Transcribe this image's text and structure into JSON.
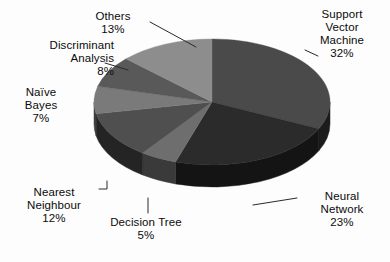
{
  "chart_data": {
    "type": "pie",
    "title": "",
    "subtitle": "",
    "xlabel": "",
    "ylabel": "",
    "legend_position": "none",
    "grid": false,
    "three_d": true,
    "categories": [
      "Support Vector Machine",
      "Neural Network",
      "Decision Tree",
      "Nearest Neighbour",
      "Naïve Bayes",
      "Discriminant Analysis",
      "Others"
    ],
    "values": [
      32,
      23,
      5,
      12,
      7,
      8,
      13
    ],
    "value_unit": "%",
    "total": 100,
    "slices": [
      {
        "name": "Support Vector Machine",
        "label_text": "Support\nVector\nMachine\n32%",
        "value": 32,
        "percent_text": "32%",
        "color": "#4a4a4a",
        "side_color": "#1c1c1c",
        "start_deg": 0,
        "end_deg": 115.2
      },
      {
        "name": "Neural Network",
        "label_text": "Neural\nNetwork\n23%",
        "value": 23,
        "percent_text": "23%",
        "color": "#2b2b2b",
        "side_color": "#141414",
        "start_deg": 115.2,
        "end_deg": 198.0
      },
      {
        "name": "Decision Tree",
        "label_text": "Decision Tree\n5%",
        "value": 5,
        "percent_text": "5%",
        "color": "#6e6e6e",
        "side_color": "#3a3a3a",
        "start_deg": 198.0,
        "end_deg": 216.0
      },
      {
        "name": "Nearest Neighbour",
        "label_text": "Nearest\nNeighbour\n12%",
        "value": 12,
        "percent_text": "12%",
        "color": "#4f4f4f",
        "side_color": "#242424",
        "start_deg": 216.0,
        "end_deg": 259.2
      },
      {
        "name": "Naïve Bayes",
        "label_text": "Naïve\nBayes\n7%",
        "value": 7,
        "percent_text": "7%",
        "color": "#7a7a7a",
        "side_color": "#3f3f3f",
        "start_deg": 259.2,
        "end_deg": 284.4
      },
      {
        "name": "Discriminant Analysis",
        "label_text": "Discriminant\nAnalysis\n8%",
        "value": 8,
        "percent_text": "8%",
        "color": "#595959",
        "side_color": "#2e2e2e",
        "start_deg": 284.4,
        "end_deg": 313.2
      },
      {
        "name": "Others",
        "label_text": "Others\n13%",
        "value": 13,
        "percent_text": "13%",
        "color": "#8d8d8d",
        "side_color": "#4d4d4d",
        "start_deg": 313.2,
        "end_deg": 360.0
      }
    ],
    "geometry": {
      "center_x": 212,
      "center_y": 102,
      "radius_x": 118,
      "radius_y": 63,
      "depth": 22
    },
    "colors": {
      "background": "#fdfdfd",
      "label_text": "#0b0b0b",
      "leader_line": "#2a2a2a"
    }
  },
  "labels": {
    "others": "Others\n13%",
    "discriminant_analysis": "Discriminant\nAnalysis\n8%",
    "naive_bayes": "Naïve\nBayes\n7%",
    "nearest_neighbour": "Nearest\nNeighbour\n12%",
    "decision_tree": "Decision Tree\n5%",
    "neural_network": "Neural\nNetwork\n23%",
    "support_vector_machine": "Support\nVector\nMachine\n32%"
  }
}
